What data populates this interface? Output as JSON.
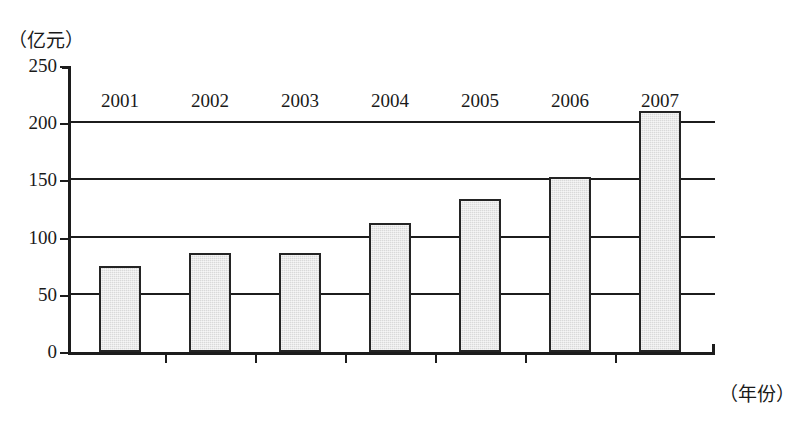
{
  "chart_data": {
    "type": "bar",
    "title": "",
    "subtitle": "",
    "categories": [
      "2001",
      "2002",
      "2003",
      "2004",
      "2005",
      "2006",
      "2007"
    ],
    "values": [
      73,
      84,
      84,
      110,
      131,
      150,
      208
    ],
    "xlabel": "（年份）",
    "ylabel": "（亿元）",
    "ylim": [
      0,
      250
    ],
    "yticks": [
      0,
      50,
      100,
      150,
      200,
      250
    ],
    "ytick_labels": [
      "0",
      "50",
      "100",
      "150",
      "200",
      "250"
    ],
    "gridlines_at": [
      50,
      100,
      150,
      200
    ],
    "grid": true,
    "legend": "none",
    "series": [
      {
        "name": "年度金额",
        "values": [
          73,
          84,
          84,
          110,
          131,
          150,
          208
        ]
      }
    ],
    "bar_fill_color": "#d9d9d9",
    "bar_border_color": "#242424",
    "axis_color": "#1c1c1c",
    "background_color": "#ffffff"
  },
  "axes": {
    "y_unit_caption": "（亿元）",
    "x_unit_caption": "（年份）"
  }
}
